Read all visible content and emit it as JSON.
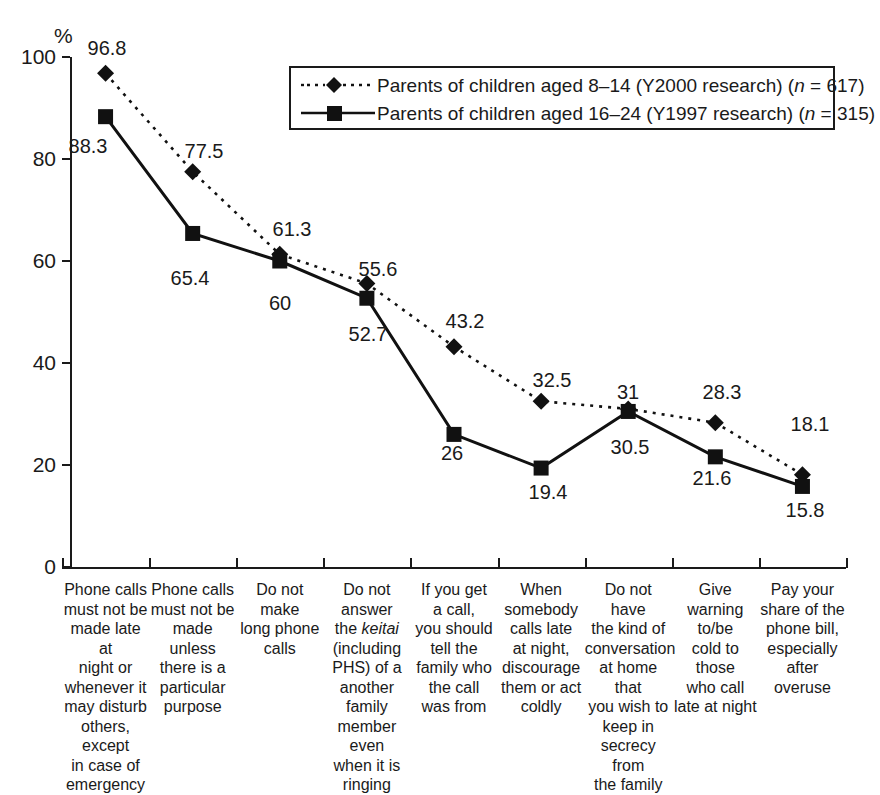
{
  "chart_data": {
    "type": "line",
    "title": "",
    "subtitle": "",
    "xlabel": "",
    "ylabel": "%",
    "ylim": [
      0,
      100
    ],
    "yticks": [
      0,
      20,
      40,
      60,
      80,
      100
    ],
    "grid": false,
    "legend_position": "top-right",
    "categories": [
      "Phone calls must not be made late at night or whenever it may disturb others, except in case of emergency",
      "Phone calls must not be made unless there is a particular purpose",
      "Do not make long phone calls",
      "Do not answer the keitai (including PHS) of a another family member even when it is ringing",
      "If you get a call, you should tell the family who the call was from",
      "When somebody calls late at night, discourage them or act coldly",
      "Do not have the kind of conversation at home that you wish to keep in secrecy from the family",
      "Give warning to/be cold to those who call late at night",
      "Pay your share of the phone bill, especially after overuse"
    ],
    "category_lines": [
      [
        "Phone calls",
        "must not be",
        "made late at",
        "night or",
        "whenever it",
        "may disturb",
        "others, except",
        "in case of",
        "emergency"
      ],
      [
        "Phone calls",
        "must not be",
        "made",
        "unless",
        "there is a",
        "particular",
        "purpose"
      ],
      [
        "Do not",
        "make",
        "long phone",
        "calls"
      ],
      [
        "Do not answer",
        "the #keitai#",
        "(including",
        "PHS) of a",
        "another family",
        "member even",
        "when it is",
        "ringing"
      ],
      [
        "If you get",
        "a call,",
        "you should",
        "tell the",
        "family who",
        "the call",
        "was from"
      ],
      [
        "When",
        "somebody",
        "calls late",
        "at night,",
        "discourage",
        "them or act",
        "coldly"
      ],
      [
        "Do not",
        "have",
        "the kind of",
        "conversation",
        "at home that",
        "you wish to",
        "keep in",
        "secrecy from",
        "the family"
      ],
      [
        "Give",
        "warning",
        "to/be",
        "cold to",
        "those",
        "who call",
        "late at night"
      ],
      [
        "Pay your",
        "share of the",
        "phone bill,",
        "especially",
        "after overuse"
      ]
    ],
    "series": [
      {
        "name": "Parents of children aged 8–14 (Y2000 research) (n = 617)",
        "marker": "diamond",
        "line_style": "dotted",
        "color": "#111111",
        "values": [
          96.8,
          77.5,
          61.3,
          55.6,
          43.2,
          32.5,
          31,
          28.3,
          18.1
        ],
        "value_labels": [
          "96.8",
          "77.5",
          "61.3",
          "55.6",
          "43.2",
          "32.5",
          "31",
          "28.3",
          "18.1"
        ]
      },
      {
        "name": "Parents of children aged 16–24 (Y1997 research) (n = 315)",
        "marker": "square",
        "line_style": "solid",
        "color": "#111111",
        "values": [
          88.3,
          65.4,
          60,
          52.7,
          26,
          19.4,
          30.5,
          21.6,
          15.8
        ],
        "value_labels": [
          "88.3",
          "65.4",
          "60",
          "52.7",
          "26",
          "19.4",
          "30.5",
          "21.6",
          "15.8"
        ]
      }
    ]
  },
  "axis": {
    "y_unit": "%",
    "y_tick_labels": [
      "100",
      "80",
      "60",
      "40",
      "20",
      "0"
    ]
  },
  "legend": {
    "entries": [
      {
        "prefix": "Parents of children aged 8–14 (Y2000 research) (",
        "italic": "n",
        "suffix": " = 617)",
        "marker": "diamond",
        "line_style": "dotted"
      },
      {
        "prefix": "Parents of children aged 16–24 (Y1997 research) (",
        "italic": "n",
        "suffix": " = 315)",
        "marker": "square",
        "line_style": "solid"
      }
    ]
  },
  "value_label_positions": {
    "series0": [
      {
        "x": 107,
        "y": 48
      },
      {
        "x": 204,
        "y": 151
      },
      {
        "x": 292,
        "y": 229
      },
      {
        "x": 378,
        "y": 269
      },
      {
        "x": 465,
        "y": 321
      },
      {
        "x": 552,
        "y": 380
      },
      {
        "x": 628,
        "y": 392
      },
      {
        "x": 722,
        "y": 392
      },
      {
        "x": 810,
        "y": 424
      }
    ],
    "series1": [
      {
        "x": 88,
        "y": 146
      },
      {
        "x": 190,
        "y": 278
      },
      {
        "x": 280,
        "y": 303
      },
      {
        "x": 368,
        "y": 334
      },
      {
        "x": 452,
        "y": 453
      },
      {
        "x": 548,
        "y": 492
      },
      {
        "x": 630,
        "y": 447
      },
      {
        "x": 712,
        "y": 478
      },
      {
        "x": 805,
        "y": 510
      }
    ]
  }
}
